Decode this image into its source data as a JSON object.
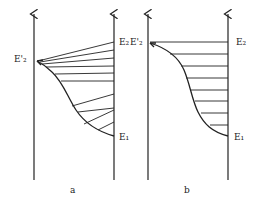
{
  "panels": [
    {
      "id": "a",
      "caption": "a",
      "labels": {
        "upper_left": "E'₂",
        "upper_right": "E₂",
        "lower_right": "E₁"
      }
    },
    {
      "id": "b",
      "caption": "b",
      "labels": {
        "upper_left": "E'₂",
        "upper_right": "E₂",
        "lower_right": "E₁"
      }
    }
  ],
  "colors": {
    "stroke": "#222222",
    "background": "#ffffff"
  }
}
